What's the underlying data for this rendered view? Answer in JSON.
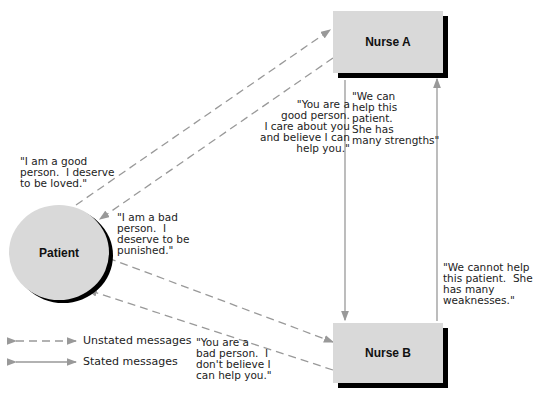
{
  "nodes": {
    "patient": "Patient",
    "nurse_a": "Nurse A",
    "nurse_b": "Nurse B"
  },
  "messages": {
    "patient_good": "\"I am a good\nperson.  I deserve\nto be loved.\"",
    "patient_bad": "\"I am a bad\nperson.  I\ndeserve to be\npunished.\"",
    "nurse_a_to_patient": "\"You are a\ngood person.\nI care about you\nand believe I can\nhelp you.\"",
    "nurse_a_to_b": "\"We can\nhelp this\npatient.\nShe has\nmany strengths\"",
    "nurse_b_to_a": "\"We cannot help\nthis patient.  She\nhas many\nweaknesses.\"",
    "nurse_b_to_patient": "\"You are a\nbad person.  I\ndon't believe I\ncan help you.\""
  },
  "legend": {
    "unstated": "Unstated messages",
    "stated": "Stated messages"
  },
  "colors": {
    "node_fill": "#d9d9d9",
    "shadow": "#000000",
    "arrow": "#999999"
  }
}
